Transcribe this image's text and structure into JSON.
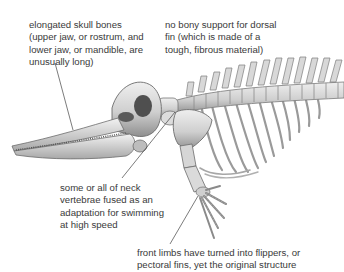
{
  "diagram": {
    "annotations": [
      {
        "id": "skull",
        "lines": [
          "elongated skull bones",
          "(upper jaw, or rostrum, and",
          "lower jaw, or mandible, are",
          "unusually long)"
        ]
      },
      {
        "id": "dorsal-fin",
        "lines": [
          "no bony support for dorsal",
          "fin (which is made of a",
          "tough, fibrous material)"
        ]
      },
      {
        "id": "neck-vertebrae",
        "lines": [
          "some or all of neck",
          "vertebrae fused as an",
          "adaptation for swimming",
          "at high speed"
        ]
      },
      {
        "id": "flippers",
        "lines": [
          "front limbs have turned into flippers, or",
          "pectoral fins, yet the original structure"
        ]
      }
    ],
    "colors": {
      "text": "#3a3a3a",
      "bone_light": "#e4e4e4",
      "bone_mid": "#b9b9b9",
      "bone_dark": "#6e6e6e",
      "leader_line": "#444444",
      "background": "#ffffff"
    }
  }
}
